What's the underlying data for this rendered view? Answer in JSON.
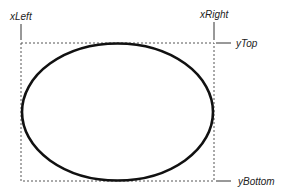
{
  "diagram": {
    "shape": "ellipse",
    "labels": {
      "x_left": "xLeft",
      "x_right": "xRight",
      "y_top": "yTop",
      "y_bottom": "yBottom"
    },
    "bounding_box": {
      "left": 21,
      "top": 43,
      "right": 214,
      "bottom": 181
    },
    "colors": {
      "stroke": "#111111",
      "dashed": "#555555",
      "text": "#222222"
    }
  }
}
